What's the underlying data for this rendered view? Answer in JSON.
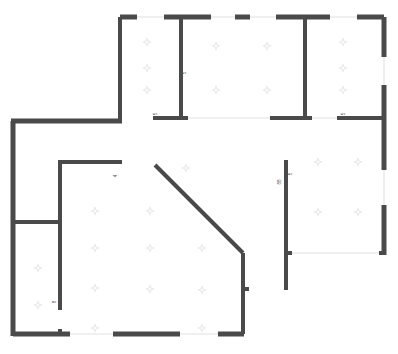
{
  "document": {
    "type": "architectural-floor-plan",
    "title": "",
    "background_color": "#ffffff",
    "wall_color": "#4a4a4a",
    "opening_color": "#e2e2e2",
    "marker_color": "#e9e9e9",
    "canvas": {
      "width": 398,
      "height": 354
    }
  },
  "dimension_labels": [
    {
      "id": "label-upper-mid-vertical",
      "text": "5",
      "x": 186,
      "y": 73,
      "rotation": -90
    },
    {
      "id": "label-upper-left-room",
      "text": "5",
      "x": 157,
      "y": 114,
      "rotation": -90
    },
    {
      "id": "label-upper-right-room",
      "text": "5",
      "x": 345,
      "y": 114,
      "rotation": -90
    },
    {
      "id": "label-lower-left-wall",
      "text": "4",
      "x": 117,
      "y": 176,
      "rotation": -90
    },
    {
      "id": "label-lower-left-inner",
      "text": "8",
      "x": 56,
      "y": 302,
      "rotation": -90
    },
    {
      "id": "label-lower-right-a",
      "text": "88",
      "x": 281,
      "y": 182,
      "rotation": -90
    },
    {
      "id": "label-lower-right-b",
      "text": "5",
      "x": 292,
      "y": 174,
      "rotation": -90
    }
  ],
  "walls": {
    "exterior_top": [
      {
        "name": "top-seg-1",
        "x1": 120,
        "y1": 17,
        "x2": 137,
        "y2": 17
      },
      {
        "name": "top-seg-2",
        "x1": 164,
        "y1": 17,
        "x2": 211,
        "y2": 17
      },
      {
        "name": "top-seg-3",
        "x1": 235,
        "y1": 17,
        "x2": 250,
        "y2": 17
      },
      {
        "name": "top-seg-4",
        "x1": 276,
        "y1": 17,
        "x2": 330,
        "y2": 17
      },
      {
        "name": "top-seg-5",
        "x1": 357,
        "y1": 17,
        "x2": 384,
        "y2": 17
      }
    ],
    "exterior_right": [
      {
        "name": "right-seg-1",
        "x1": 384,
        "y1": 17,
        "x2": 384,
        "y2": 57
      },
      {
        "name": "right-seg-2",
        "x1": 384,
        "y1": 85,
        "x2": 384,
        "y2": 170
      },
      {
        "name": "right-seg-3",
        "x1": 384,
        "y1": 205,
        "x2": 384,
        "y2": 255
      }
    ],
    "exterior_left": [
      {
        "name": "left-upper-horizontal",
        "x1": 11,
        "y1": 121,
        "x2": 122,
        "y2": 121
      },
      {
        "name": "left-vertical",
        "x1": 13,
        "y1": 121,
        "x2": 13,
        "y2": 336
      }
    ],
    "exterior_bottom": [
      {
        "name": "bottom-seg-1",
        "x1": 13,
        "y1": 334,
        "x2": 70,
        "y2": 334
      },
      {
        "name": "bottom-seg-2",
        "x1": 113,
        "y1": 334,
        "x2": 180,
        "y2": 334
      },
      {
        "name": "bottom-seg-3",
        "x1": 218,
        "y1": 334,
        "x2": 244,
        "y2": 334
      }
    ],
    "interior": [
      {
        "name": "partition-upper-left-vertical",
        "x1": 120,
        "y1": 17,
        "x2": 120,
        "y2": 121
      },
      {
        "name": "partition-upper-mid-vertical",
        "x1": 181,
        "y1": 17,
        "x2": 181,
        "y2": 118
      },
      {
        "name": "partition-upper-mid-foot",
        "x1": 153,
        "y1": 118,
        "x2": 188,
        "y2": 118
      },
      {
        "name": "partition-upper-right-vertical",
        "x1": 305,
        "y1": 17,
        "x2": 305,
        "y2": 118
      },
      {
        "name": "partition-upper-right-foot",
        "x1": 270,
        "y1": 118,
        "x2": 312,
        "y2": 118
      },
      {
        "name": "partition-right-room-foot",
        "x1": 337,
        "y1": 118,
        "x2": 384,
        "y2": 118
      },
      {
        "name": "lower-left-room-top",
        "x1": 58,
        "y1": 162,
        "x2": 122,
        "y2": 162
      },
      {
        "name": "lower-left-room-vertical",
        "x1": 60,
        "y1": 162,
        "x2": 60,
        "y2": 310
      },
      {
        "name": "lower-left-divider",
        "x1": 13,
        "y1": 222,
        "x2": 62,
        "y2": 222
      },
      {
        "name": "bottom-left-stub",
        "x1": 60,
        "y1": 329,
        "x2": 60,
        "y2": 336
      },
      {
        "name": "right-room-vertical",
        "x1": 286,
        "y1": 160,
        "x2": 286,
        "y2": 290
      },
      {
        "name": "right-room-bottom-stub",
        "x1": 286,
        "y1": 253,
        "x2": 292,
        "y2": 253
      },
      {
        "name": "right-room-right-stub",
        "x1": 379,
        "y1": 253,
        "x2": 384,
        "y2": 253
      }
    ],
    "diagonal": [
      {
        "name": "diagonal-wall",
        "x1": 155,
        "y1": 165,
        "x2": 243,
        "y2": 253
      },
      {
        "name": "diagonal-lower-vertical",
        "x1": 243,
        "y1": 253,
        "x2": 243,
        "y2": 334
      },
      {
        "name": "diagonal-door-stub",
        "x1": 243,
        "y1": 289,
        "x2": 249,
        "y2": 289
      }
    ]
  },
  "openings": [
    {
      "name": "window-top-1",
      "x1": 137,
      "y1": 17,
      "x2": 164,
      "y2": 17
    },
    {
      "name": "window-top-2",
      "x1": 211,
      "y1": 17,
      "x2": 235,
      "y2": 17
    },
    {
      "name": "window-top-3",
      "x1": 250,
      "y1": 17,
      "x2": 276,
      "y2": 17
    },
    {
      "name": "window-top-4",
      "x1": 330,
      "y1": 17,
      "x2": 357,
      "y2": 17
    },
    {
      "name": "window-right-1",
      "x1": 384,
      "y1": 57,
      "x2": 384,
      "y2": 85
    },
    {
      "name": "window-right-2",
      "x1": 384,
      "y1": 170,
      "x2": 384,
      "y2": 205
    },
    {
      "name": "door-mid-horizontal",
      "x1": 188,
      "y1": 118,
      "x2": 270,
      "y2": 118
    },
    {
      "name": "door-right-horizontal",
      "x1": 312,
      "y1": 118,
      "x2": 337,
      "y2": 118
    },
    {
      "name": "door-bottom-1",
      "x1": 70,
      "y1": 334,
      "x2": 113,
      "y2": 334
    },
    {
      "name": "door-bottom-2",
      "x1": 180,
      "y1": 334,
      "x2": 218,
      "y2": 334
    },
    {
      "name": "door-right-room-bottom",
      "x1": 292,
      "y1": 253,
      "x2": 379,
      "y2": 253
    }
  ],
  "markers": [
    {
      "x": 147,
      "y": 42
    },
    {
      "x": 147,
      "y": 68
    },
    {
      "x": 147,
      "y": 90
    },
    {
      "x": 216,
      "y": 46
    },
    {
      "x": 216,
      "y": 90
    },
    {
      "x": 267,
      "y": 46
    },
    {
      "x": 267,
      "y": 90
    },
    {
      "x": 343,
      "y": 42
    },
    {
      "x": 343,
      "y": 68
    },
    {
      "x": 343,
      "y": 90
    },
    {
      "x": 95,
      "y": 211
    },
    {
      "x": 95,
      "y": 248
    },
    {
      "x": 38,
      "y": 268
    },
    {
      "x": 38,
      "y": 305
    },
    {
      "x": 95,
      "y": 288
    },
    {
      "x": 95,
      "y": 328
    },
    {
      "x": 150,
      "y": 211
    },
    {
      "x": 150,
      "y": 248
    },
    {
      "x": 150,
      "y": 289
    },
    {
      "x": 202,
      "y": 248
    },
    {
      "x": 202,
      "y": 290
    },
    {
      "x": 202,
      "y": 328
    },
    {
      "x": 318,
      "y": 162
    },
    {
      "x": 358,
      "y": 162
    },
    {
      "x": 318,
      "y": 212
    },
    {
      "x": 358,
      "y": 212
    },
    {
      "x": 186,
      "y": 168
    }
  ]
}
